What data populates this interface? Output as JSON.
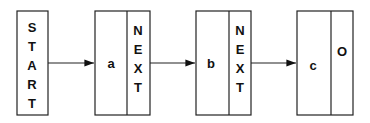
{
  "diagram": {
    "start": {
      "label": [
        "S",
        "T",
        "A",
        "R",
        "T"
      ]
    },
    "nodes": [
      {
        "value": "a",
        "next": [
          "N",
          "E",
          "X",
          "T"
        ]
      },
      {
        "value": "b",
        "next": [
          "N",
          "E",
          "X",
          "T"
        ]
      },
      {
        "value": "c",
        "next": [
          "O"
        ]
      }
    ]
  }
}
